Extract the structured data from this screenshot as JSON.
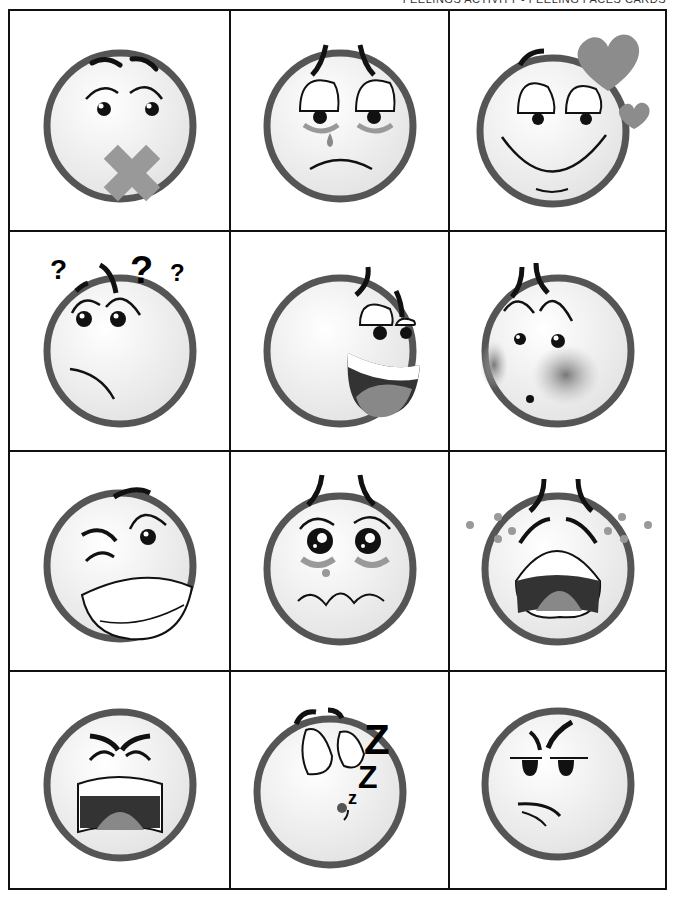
{
  "header": {
    "title": "FEELINGS ACTIVITY - FEELING FACES CARDS"
  },
  "colors": {
    "ring": "#555555",
    "face": "#f4f4f4",
    "accent_gray": "#8a8a8a",
    "heart": "#8c8c8c",
    "ink": "#111111",
    "border": "#111111"
  },
  "cards": [
    {
      "emotion": "Speechless",
      "icon": "tape-over-mouth-face-icon"
    },
    {
      "emotion": "Sad",
      "icon": "crying-tear-face-icon"
    },
    {
      "emotion": "In Love",
      "icon": "hearts-face-icon"
    },
    {
      "emotion": "Confused",
      "icon": "question-marks-face-icon"
    },
    {
      "emotion": "Happy",
      "icon": "laughing-face-icon"
    },
    {
      "emotion": "Embarrassed",
      "icon": "blushing-face-icon"
    },
    {
      "emotion": "Silly",
      "icon": "winking-face-icon"
    },
    {
      "emotion": "Worried",
      "icon": "teary-eyes-face-icon"
    },
    {
      "emotion": "Crying",
      "icon": "sobbing-face-icon"
    },
    {
      "emotion": "Angry",
      "icon": "yelling-face-icon"
    },
    {
      "emotion": "Sleepy",
      "icon": "sleeping-zzz-face-icon"
    },
    {
      "emotion": "Annoyed",
      "icon": "suspicious-face-icon"
    }
  ],
  "sleep_text": {
    "big": "Z",
    "mid": "Z",
    "small": "z"
  },
  "question_mark": "?"
}
